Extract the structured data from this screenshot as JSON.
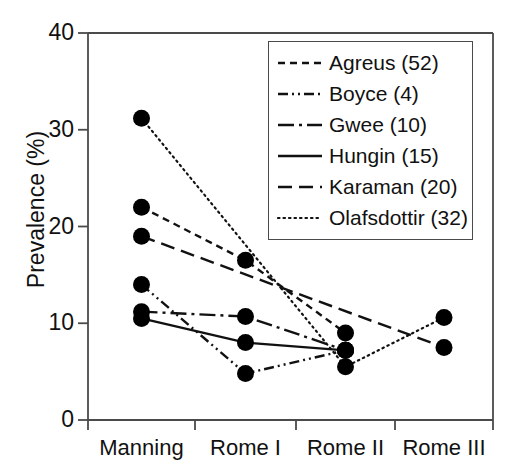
{
  "chart_data": {
    "type": "line",
    "title": "",
    "xlabel": "",
    "ylabel": "Prevalence (%)",
    "categories": [
      "Manning",
      "Rome I",
      "Rome II",
      "Rome III"
    ],
    "xtick_labels": [
      "Manning",
      "Rome I",
      "Rome II",
      "Rome III"
    ],
    "ytick_labels": [
      "0",
      "10",
      "20",
      "30",
      "40"
    ],
    "yticks": [
      0,
      10,
      20,
      30,
      40
    ],
    "ylim": [
      0,
      40
    ],
    "grid": false,
    "legend_position": "upper right",
    "marker": "filled-circle",
    "series": [
      {
        "name": "Agreus (52)",
        "legend_label": "Agreus (52)",
        "n": 52,
        "linestyle": "dashed",
        "dasharray": "7,5",
        "points": [
          {
            "category": "Manning",
            "value": 22.0
          },
          {
            "category": "Rome I",
            "value": 16.5
          },
          {
            "category": "Rome II",
            "value": 9.0
          }
        ]
      },
      {
        "name": "Boyce (4)",
        "legend_label": "Boyce (4)",
        "n": 4,
        "linestyle": "dash-dot-dot",
        "dasharray": "10,4,2,4,2,4",
        "points": [
          {
            "category": "Manning",
            "value": 14.0
          },
          {
            "category": "Rome I",
            "value": 4.8
          },
          {
            "category": "Rome II",
            "value": 7.2
          }
        ]
      },
      {
        "name": "Gwee (10)",
        "legend_label": "Gwee (10)",
        "n": 10,
        "linestyle": "dash-dot",
        "dasharray": "16,5,3,5",
        "points": [
          {
            "category": "Manning",
            "value": 11.2
          },
          {
            "category": "Rome I",
            "value": 10.7
          },
          {
            "category": "Rome II",
            "value": 7.2
          }
        ]
      },
      {
        "name": "Hungin (15)",
        "legend_label": "Hungin (15)",
        "n": 15,
        "linestyle": "solid",
        "dasharray": "",
        "points": [
          {
            "category": "Manning",
            "value": 10.5
          },
          {
            "category": "Rome I",
            "value": 8.0
          },
          {
            "category": "Rome II",
            "value": 7.2
          }
        ]
      },
      {
        "name": "Karaman (20)",
        "legend_label": "Karaman (20)",
        "n": 20,
        "linestyle": "long-dash",
        "dasharray": "14,7",
        "points": [
          {
            "category": "Manning",
            "value": 19.0
          },
          {
            "category": "Rome III",
            "value": 7.5
          }
        ]
      },
      {
        "name": "Olafsdottir (32)",
        "legend_label": "Olafsdottir (32)",
        "n": 32,
        "linestyle": "dotted",
        "dasharray": "1.5,4",
        "points": [
          {
            "category": "Manning",
            "value": 31.2
          },
          {
            "category": "Rome II",
            "value": 5.5
          },
          {
            "category": "Rome III",
            "value": 10.6
          }
        ]
      }
    ]
  },
  "colors": {
    "line": "#111111",
    "marker": "#000000",
    "axis": "#4a4a4a",
    "background": "#ffffff"
  }
}
